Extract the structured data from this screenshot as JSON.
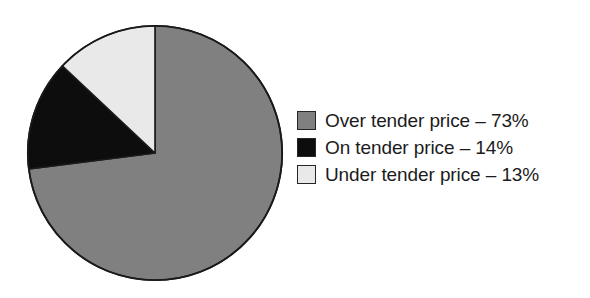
{
  "chart_data": {
    "type": "pie",
    "title": "",
    "subtitle": "",
    "xlabel": "",
    "ylabel": "",
    "grid": false,
    "legend_position": "right",
    "start_angle_deg": 0,
    "direction": "clockwise",
    "unit": "%",
    "categories": [
      "Over tender price",
      "On tender price",
      "Under tender price"
    ],
    "values": [
      73,
      14,
      13
    ],
    "slices": [
      {
        "label": "Over tender price",
        "value": 73,
        "value_text": "73%",
        "legend_text": "Over tender price – 73%",
        "color": "#808080",
        "stroke": "#1a1a1a"
      },
      {
        "label": "On tender price",
        "value": 14,
        "value_text": "14%",
        "legend_text": "On tender price – 14%",
        "color": "#0d0d0d",
        "stroke": "#1a1a1a"
      },
      {
        "label": "Under tender price",
        "value": 13,
        "value_text": "13%",
        "legend_text": "Under tender price – 13%",
        "color": "#e9e9e9",
        "stroke": "#1a1a1a"
      }
    ]
  },
  "legend": {
    "items": [
      {
        "label": "Over tender price – 73%",
        "swatch_color": "#808080"
      },
      {
        "label": "On tender price – 14%",
        "swatch_color": "#0d0d0d"
      },
      {
        "label": "Under tender price – 13%",
        "swatch_color": "#e9e9e9"
      }
    ]
  },
  "canvas": {
    "background": "#ffffff",
    "outline_color": "#1a1a1a"
  }
}
